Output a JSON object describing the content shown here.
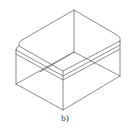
{
  "figure": {
    "caption": "b)",
    "stroke_color": "#555555"
  }
}
